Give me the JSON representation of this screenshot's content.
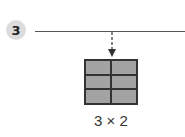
{
  "step": {
    "number": "3"
  },
  "grid": {
    "rows": 3,
    "cols": 2,
    "fill_color": "#a6a6a6",
    "border_color": "#333333"
  },
  "label": {
    "text": "3 × 2"
  }
}
